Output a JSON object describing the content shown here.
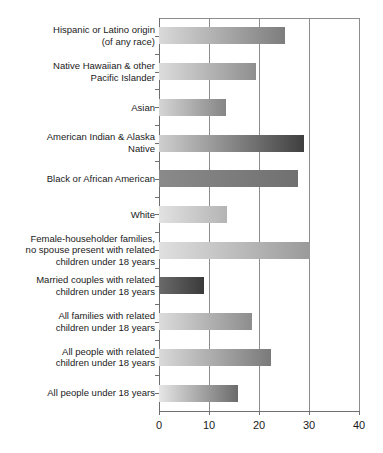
{
  "chart_data": {
    "type": "bar",
    "orientation": "horizontal",
    "title": "",
    "subtitle": "",
    "xlabel": "",
    "ylabel": "",
    "xlim": [
      0,
      40
    ],
    "ylim": null,
    "grid": "vertical",
    "legend": "none",
    "xticks": [
      "0",
      "10",
      "20",
      "30",
      "40"
    ],
    "xtick_values": [
      0,
      10,
      20,
      30,
      40
    ],
    "categories": [
      "Hispanic or Latino origin (of any race)",
      "Native Hawaiian & other Pacific Islander",
      "Asian",
      "American Indian & Alaska Native",
      "Black or African American",
      "White",
      "Female-householder families, no spouse present with related children under 18 years",
      "Married couples with related children under 18 years",
      "All families with related children under 18 years",
      "All people with related children under 18 years",
      "All people under 18 years"
    ],
    "values": [
      25.2,
      19.4,
      13.4,
      29.0,
      27.8,
      13.6,
      30.2,
      9.0,
      18.6,
      22.4,
      15.8
    ]
  },
  "rows": [
    {
      "label_lines": [
        "Hispanic or Latino origin",
        "(of any race)"
      ],
      "value": 25.2,
      "bar_start_color": "#d9d9d9",
      "bar_end_color": "#7d7d7d"
    },
    {
      "label_lines": [
        "Native Hawaiian & other",
        "Pacific Islander"
      ],
      "value": 19.4,
      "bar_start_color": "#dcdcdc",
      "bar_end_color": "#8f8f8f"
    },
    {
      "label_lines": [
        "Asian"
      ],
      "value": 13.4,
      "bar_start_color": "#d5d5d5",
      "bar_end_color": "#858585"
    },
    {
      "label_lines": [
        "American Indian & Alaska",
        "Native"
      ],
      "value": 29.0,
      "bar_start_color": "#cfcfcf",
      "bar_end_color": "#3f3f3f"
    },
    {
      "label_lines": [
        "Black or African American"
      ],
      "value": 27.8,
      "bar_start_color": "#8a8a8a",
      "bar_end_color": "#707070"
    },
    {
      "label_lines": [
        "White"
      ],
      "value": 13.6,
      "bar_start_color": "#e2e2e2",
      "bar_end_color": "#b4b4b4"
    },
    {
      "label_lines": [
        "Female-householder families,",
        "no spouse present with related",
        "children under 18 years"
      ],
      "value": 30.2,
      "bar_start_color": "#e0e0e0",
      "bar_end_color": "#9a9a9a"
    },
    {
      "label_lines": [
        "Married couples with related",
        "children under 18 years"
      ],
      "value": 9.0,
      "bar_start_color": "#6a6a6a",
      "bar_end_color": "#3a3a3a"
    },
    {
      "label_lines": [
        "All families with related",
        "children under 18 years"
      ],
      "value": 18.6,
      "bar_start_color": "#dcdcdc",
      "bar_end_color": "#8d8d8d"
    },
    {
      "label_lines": [
        "All people with related",
        "children under 18 years"
      ],
      "value": 22.4,
      "bar_start_color": "#d9d9d9",
      "bar_end_color": "#7a7a7a"
    },
    {
      "label_lines": [
        "All people under 18 years"
      ],
      "value": 15.8,
      "bar_start_color": "#e6e6e6",
      "bar_end_color": "#6b6b6b"
    }
  ],
  "axis": {
    "color": "#6f6f6f",
    "gridline_color": "#8c8c8c"
  }
}
